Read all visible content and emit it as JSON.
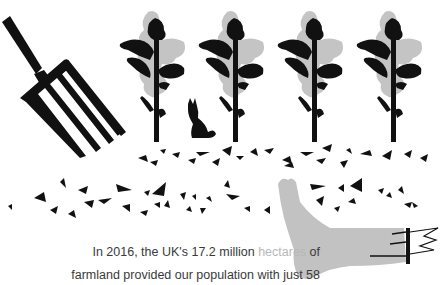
{
  "illustration": {
    "description": "Farm illustration: pitchfork, four plants, hare, scattered soil fragments, severed grey leg",
    "colors": {
      "ink": "#111111",
      "foliage_light": "#c4c4c4",
      "leg": "#c2c2c2",
      "background": "#ffffff"
    },
    "plant_count": 4
  },
  "caption": {
    "part1": "In 2016, the UK's 17.2 million ",
    "link_text": "hectares",
    "part2": " of",
    "line2": "farmland provided our population with just 58",
    "link_color": "#b8b8b8"
  }
}
